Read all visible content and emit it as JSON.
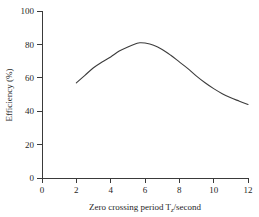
{
  "chart_data": {
    "type": "line",
    "title": "",
    "subtitle": "",
    "xlabel": "Zero crossing period T",
    "xlabel_subscript": "z",
    "xlabel_suffix": "/second",
    "ylabel": "Efficiency (%)",
    "xlim": [
      0,
      12
    ],
    "ylim": [
      0,
      100
    ],
    "xticks": [
      0,
      2,
      4,
      6,
      8,
      10,
      12
    ],
    "yticks": [
      0,
      20,
      40,
      60,
      80,
      100
    ],
    "xtick_labels": [
      "0",
      "2",
      "4",
      "6",
      "8",
      "10",
      "12"
    ],
    "ytick_labels": [
      "0",
      "20",
      "40",
      "60",
      "80",
      "100"
    ],
    "grid": false,
    "legend": false,
    "legend_position": "none",
    "line_color": "#3c3c3c",
    "background_color": "#ffffff",
    "series": [
      {
        "name": "Efficiency",
        "x": [
          2.0,
          2.5,
          3.0,
          3.5,
          4.0,
          4.5,
          5.0,
          5.5,
          5.7,
          6.0,
          6.5,
          7.0,
          7.5,
          8.0,
          8.5,
          9.0,
          9.5,
          10.0,
          10.5,
          11.0,
          11.5,
          12.0
        ],
        "values": [
          57.0,
          61.5,
          66.0,
          69.5,
          72.5,
          76.0,
          78.5,
          80.5,
          81.0,
          80.8,
          79.5,
          77.0,
          73.5,
          69.5,
          65.5,
          61.0,
          57.0,
          53.5,
          50.5,
          48.0,
          46.0,
          44.0
        ]
      }
    ],
    "annotations": []
  }
}
